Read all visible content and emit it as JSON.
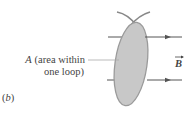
{
  "figure": {
    "panel_label": "(b)",
    "panel_letter": "b",
    "area_label": {
      "symbol": "A",
      "line1_rest": "(area within",
      "line2": "one loop)"
    },
    "field_label": {
      "symbol": "B",
      "vector_arrow": true
    },
    "colors": {
      "loop_fill": "#c8c8c8",
      "loop_edge": "#9a9a9a",
      "field_line": "#555555",
      "leader_line": "#aaaaaa",
      "text": "#444444"
    }
  }
}
